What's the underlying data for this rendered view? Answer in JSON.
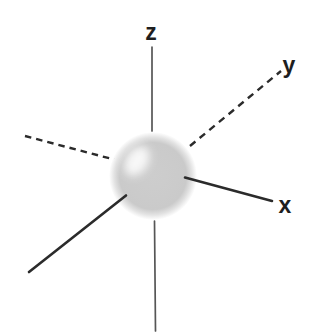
{
  "figure": {
    "kind": "3d-axes-with-spherical-orbital",
    "axis_labels": {
      "x": "x",
      "y": "y",
      "z": "z"
    }
  },
  "colors": {
    "background": "#ffffff",
    "solid_axis": "#2b2b2b",
    "dashed_axis": "#2b2b2b",
    "vertical_axis": "#565656",
    "label_text": "#1e1e1e",
    "sphere_base": "#cbcbcb",
    "sphere_highlight": "#ffffff"
  }
}
